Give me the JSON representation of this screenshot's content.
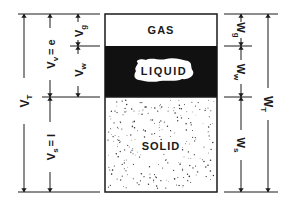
{
  "diagram": {
    "phases": [
      {
        "id": "gas",
        "label": "GAS"
      },
      {
        "id": "liquid",
        "label": "LIQUID"
      },
      {
        "id": "solid",
        "label": "SOLID"
      }
    ],
    "volume_labels": {
      "total": "V",
      "total_sub": "T",
      "voids": "V",
      "voids_sub": "v",
      "voids_eq": "= e",
      "gas": "V",
      "gas_sub": "g",
      "water": "V",
      "water_sub": "w",
      "solids": "V",
      "solids_sub": "s",
      "solids_eq": "= I"
    },
    "weight_labels": {
      "total": "W",
      "total_sub": "T",
      "gas": "W",
      "gas_sub": "g",
      "water": "W",
      "water_sub": "w",
      "solids": "W",
      "solids_sub": "s"
    },
    "colors": {
      "line": "#1a1a1a",
      "liquid_fill": "#111111",
      "background": "#ffffff"
    }
  }
}
